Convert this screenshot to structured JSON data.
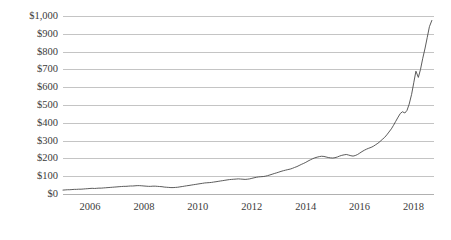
{
  "chart_data": {
    "type": "line",
    "title": "",
    "subtitle": "",
    "xlabel": "",
    "ylabel": "",
    "grid": "horizontal",
    "legend": "none",
    "xlim": [
      2005.0,
      2018.75
    ],
    "ylim": [
      0,
      1000
    ],
    "y_ticks": [
      0,
      100,
      200,
      300,
      400,
      500,
      600,
      700,
      800,
      900,
      1000
    ],
    "y_tick_labels": [
      "$0",
      "$100",
      "$200",
      "$300",
      "$400",
      "$500",
      "$600",
      "$700",
      "$800",
      "$900",
      "$1,000"
    ],
    "x_ticks": [
      2006,
      2008,
      2010,
      2012,
      2014,
      2016,
      2018
    ],
    "x_tick_labels": [
      "2006",
      "2008",
      "2010",
      "2012",
      "2014",
      "2016",
      "2018"
    ],
    "value_prefix": "$",
    "line_color": "#4a4a4a",
    "gridline_color": "#c4c4c4",
    "axis_text_color": "#3b3b3b",
    "series": [
      {
        "name": "Price",
        "x": [
          2005.0,
          2005.08,
          2005.17,
          2005.25,
          2005.33,
          2005.42,
          2005.5,
          2005.58,
          2005.67,
          2005.75,
          2005.83,
          2005.92,
          2006.0,
          2006.08,
          2006.17,
          2006.25,
          2006.33,
          2006.42,
          2006.5,
          2006.58,
          2006.67,
          2006.75,
          2006.83,
          2006.92,
          2007.0,
          2007.08,
          2007.17,
          2007.25,
          2007.33,
          2007.42,
          2007.5,
          2007.58,
          2007.67,
          2007.75,
          2007.83,
          2007.92,
          2008.0,
          2008.08,
          2008.17,
          2008.25,
          2008.33,
          2008.42,
          2008.5,
          2008.58,
          2008.67,
          2008.75,
          2008.83,
          2008.92,
          2009.0,
          2009.08,
          2009.17,
          2009.25,
          2009.33,
          2009.42,
          2009.5,
          2009.58,
          2009.67,
          2009.75,
          2009.83,
          2009.92,
          2010.0,
          2010.08,
          2010.17,
          2010.25,
          2010.33,
          2010.42,
          2010.5,
          2010.58,
          2010.67,
          2010.75,
          2010.83,
          2010.92,
          2011.0,
          2011.08,
          2011.17,
          2011.25,
          2011.33,
          2011.42,
          2011.5,
          2011.58,
          2011.67,
          2011.75,
          2011.83,
          2011.92,
          2012.0,
          2012.08,
          2012.17,
          2012.25,
          2012.33,
          2012.42,
          2012.5,
          2012.58,
          2012.67,
          2012.75,
          2012.83,
          2012.92,
          2013.0,
          2013.08,
          2013.17,
          2013.25,
          2013.33,
          2013.42,
          2013.5,
          2013.58,
          2013.67,
          2013.75,
          2013.83,
          2013.92,
          2014.0,
          2014.08,
          2014.17,
          2014.25,
          2014.33,
          2014.42,
          2014.5,
          2014.58,
          2014.67,
          2014.75,
          2014.83,
          2014.92,
          2015.0,
          2015.08,
          2015.17,
          2015.25,
          2015.33,
          2015.42,
          2015.5,
          2015.58,
          2015.67,
          2015.75,
          2015.83,
          2015.92,
          2016.0,
          2016.08,
          2016.17,
          2016.25,
          2016.33,
          2016.42,
          2016.5,
          2016.58,
          2016.67,
          2016.75,
          2016.83,
          2016.92,
          2017.0,
          2017.08,
          2017.17,
          2017.25,
          2017.33,
          2017.42,
          2017.5,
          2017.58,
          2017.67,
          2017.75,
          2017.83,
          2017.92,
          2018.0,
          2018.08,
          2018.17,
          2018.25,
          2018.33,
          2018.42,
          2018.5,
          2018.58,
          2018.67
        ],
        "values": [
          22,
          23,
          24,
          24,
          25,
          26,
          26,
          27,
          27,
          28,
          29,
          30,
          31,
          32,
          31,
          32,
          33,
          33,
          34,
          35,
          36,
          37,
          38,
          39,
          40,
          41,
          42,
          43,
          43,
          44,
          45,
          45,
          46,
          47,
          47,
          46,
          45,
          44,
          43,
          43,
          44,
          44,
          43,
          42,
          41,
          39,
          38,
          37,
          36,
          36,
          37,
          38,
          40,
          42,
          44,
          46,
          48,
          50,
          52,
          54,
          56,
          58,
          60,
          62,
          63,
          64,
          65,
          67,
          69,
          71,
          73,
          75,
          77,
          79,
          81,
          82,
          83,
          84,
          85,
          84,
          83,
          82,
          83,
          85,
          88,
          91,
          94,
          96,
          97,
          98,
          100,
          103,
          107,
          111,
          115,
          119,
          123,
          127,
          131,
          134,
          137,
          140,
          144,
          149,
          154,
          160,
          166,
          172,
          178,
          185,
          192,
          198,
          203,
          207,
          210,
          212,
          211,
          208,
          205,
          203,
          202,
          204,
          208,
          213,
          217,
          220,
          222,
          219,
          215,
          213,
          216,
          222,
          230,
          238,
          246,
          252,
          257,
          262,
          268,
          276,
          285,
          295,
          306,
          318,
          332,
          348,
          366,
          386,
          408,
          432,
          452,
          462,
          455,
          470,
          505,
          560,
          625,
          690,
          655,
          700,
          760,
          820,
          880,
          940,
          975
        ]
      }
    ],
    "series_end_note": "final point dips to ~940"
  }
}
